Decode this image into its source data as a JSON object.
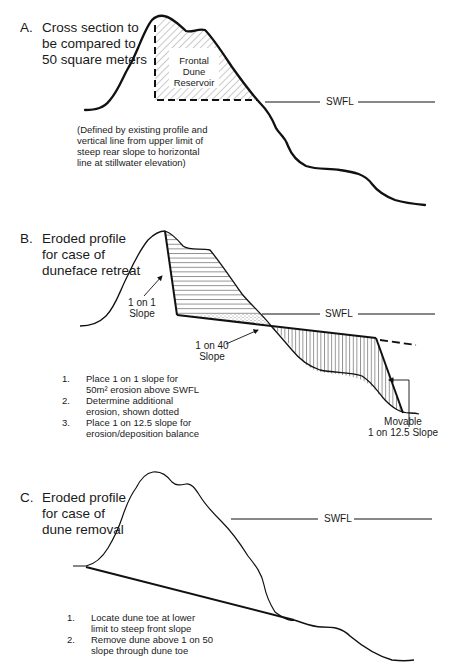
{
  "panels": {
    "A": {
      "letter": "A.",
      "title_lines": [
        "Cross section to",
        "be compared to",
        "50 square meters"
      ],
      "reservoir_label_lines": [
        "Frontal",
        "Dune",
        "Reservoir"
      ],
      "swfl_label": "SWFL",
      "note_lines": [
        "(Defined by existing profile and",
        "vertical line from upper limit of",
        "steep rear slope to horizontal",
        "line at stillwater elevation)"
      ]
    },
    "B": {
      "letter": "B.",
      "title_lines": [
        "Eroded profile",
        "for case of",
        "duneface retreat"
      ],
      "swfl_label": "SWFL",
      "slope_1on1_lines": [
        "1 on 1",
        "Slope"
      ],
      "slope_1on40_lines": [
        "1 on 40",
        "Slope"
      ],
      "movable_lines": [
        "Movable",
        "1 on 12.5 Slope"
      ],
      "steps": [
        {
          "num": "1.",
          "lines": [
            "Place 1 on 1 slope for",
            "50m² erosion above SWFL"
          ]
        },
        {
          "num": "2.",
          "lines": [
            "Determine additional",
            "erosion, shown dotted"
          ]
        },
        {
          "num": "3.",
          "lines": [
            "Place 1 on 12.5 slope for",
            "erosion/deposition balance"
          ]
        }
      ]
    },
    "C": {
      "letter": "C.",
      "title_lines": [
        "Eroded profile",
        "for case of",
        "dune removal"
      ],
      "swfl_label": "SWFL",
      "steps": [
        {
          "num": "1.",
          "lines": [
            "Locate dune toe at lower",
            "limit to steep front slope"
          ]
        },
        {
          "num": "2.",
          "lines": [
            "Remove dune above 1 on 50",
            "slope through dune toe"
          ]
        }
      ]
    }
  },
  "colors": {
    "line": "#111111",
    "hatch": "#555555",
    "background": "#ffffff"
  }
}
